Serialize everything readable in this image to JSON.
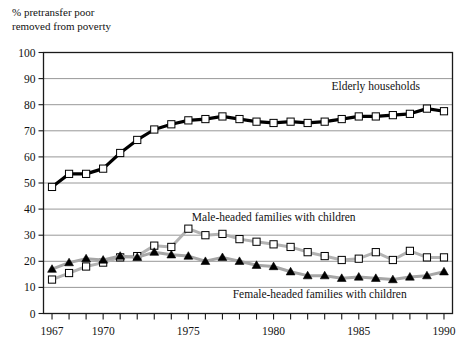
{
  "chart_data": {
    "type": "line",
    "title": "% pretransfer poor\nremoved from poverty",
    "xlabel": "",
    "ylabel": "% pretransfer poor removed from poverty",
    "xlim": [
      1966.5,
      1990.5
    ],
    "ylim": [
      0,
      100
    ],
    "grid": true,
    "legend_position": "inline-annotations",
    "ytick_labels": [
      "0",
      "10",
      "20",
      "30",
      "40",
      "50",
      "60",
      "70",
      "80",
      "90",
      "100"
    ],
    "yticks": [
      0,
      10,
      20,
      30,
      40,
      50,
      60,
      70,
      80,
      90,
      100
    ],
    "xtick_labels": [
      "1967",
      "1970",
      "1975",
      "1980",
      "1985",
      "1990"
    ],
    "xticks_labeled": [
      1967,
      1970,
      1975,
      1980,
      1985,
      1990
    ],
    "x": [
      1967,
      1968,
      1969,
      1970,
      1971,
      1972,
      1973,
      1974,
      1975,
      1976,
      1977,
      1978,
      1979,
      1980,
      1981,
      1982,
      1983,
      1984,
      1985,
      1986,
      1987,
      1988,
      1989,
      1990
    ],
    "series": [
      {
        "name": "Elderly households",
        "marker": "open-square",
        "line_color": "#000000",
        "marker_face": "#ffffff",
        "values": [
          48.5,
          53.5,
          53.5,
          55.5,
          61.5,
          66.5,
          70.5,
          72.5,
          74.0,
          74.5,
          75.5,
          74.5,
          73.5,
          73.0,
          73.5,
          73.0,
          73.5,
          74.5,
          75.5,
          75.5,
          76.0,
          76.5,
          78.5,
          77.5
        ]
      },
      {
        "name": "Male-headed families with children",
        "marker": "open-square",
        "line_color": "#b3b3b3",
        "marker_face": "#ffffff",
        "values": [
          13.0,
          15.5,
          18.0,
          19.5,
          21.5,
          22.0,
          26.0,
          25.5,
          32.5,
          30.0,
          30.5,
          28.5,
          27.5,
          26.5,
          25.5,
          23.5,
          22.0,
          20.5,
          21.0,
          23.5,
          20.5,
          24.0,
          21.5,
          21.5
        ]
      },
      {
        "name": "Female-headed families with children",
        "marker": "filled-triangle",
        "line_color": "#a6a6a6",
        "marker_face": "#000000",
        "values": [
          17.0,
          19.5,
          21.0,
          20.5,
          22.0,
          21.5,
          23.5,
          22.5,
          22.0,
          20.0,
          21.5,
          20.0,
          18.5,
          18.0,
          16.0,
          14.5,
          14.5,
          13.5,
          14.0,
          13.5,
          13.0,
          14.0,
          14.5,
          16.0
        ]
      }
    ],
    "annotations": [
      {
        "text": "Elderly households",
        "x": 1983.4,
        "y": 85.5
      },
      {
        "text": "Male-headed families with children",
        "x": 1975.2,
        "y": 35.5
      },
      {
        "text": "Female-headed families with children",
        "x": 1977.6,
        "y": 6.0
      }
    ]
  }
}
